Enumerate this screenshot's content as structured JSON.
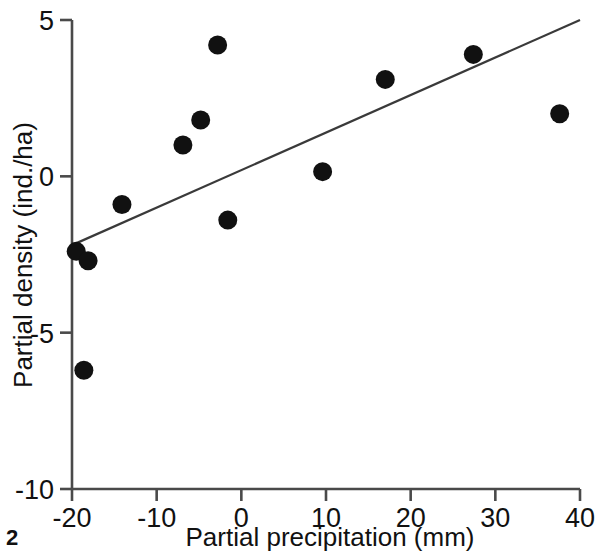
{
  "figure": {
    "number_label": "2",
    "line_color": "#3a3a3a",
    "point_color": "#111111",
    "axis_color": "#4a4a4a",
    "background_color": "#ffffff"
  },
  "chart_data": {
    "type": "scatter",
    "title": "",
    "xlabel": "Partial precipitation (mm)",
    "ylabel": "Partial density (ind./ha)",
    "xlim": [
      -20,
      40
    ],
    "ylim": [
      -10,
      5
    ],
    "xticks": [
      -20,
      -10,
      0,
      10,
      20,
      30,
      40
    ],
    "xtick_labels": [
      "-20",
      "-10",
      "0",
      "10",
      "20",
      "30",
      "40"
    ],
    "yticks": [
      -10,
      -5,
      0,
      5
    ],
    "ytick_labels": [
      "-10",
      "-5",
      "0",
      "5"
    ],
    "grid": false,
    "legend": false,
    "series": [
      {
        "name": "observations",
        "marker": "filled-circle",
        "points": [
          {
            "x": -19.5,
            "y": -2.4
          },
          {
            "x": -18.6,
            "y": -6.2
          },
          {
            "x": -18.1,
            "y": -2.7
          },
          {
            "x": -14.1,
            "y": -0.9
          },
          {
            "x": -6.9,
            "y": 1.0
          },
          {
            "x": -4.8,
            "y": 1.8
          },
          {
            "x": -2.8,
            "y": 4.2
          },
          {
            "x": -1.6,
            "y": -1.4
          },
          {
            "x": 9.6,
            "y": 0.15
          },
          {
            "x": 17.0,
            "y": 3.1
          },
          {
            "x": 27.4,
            "y": 3.9
          },
          {
            "x": 37.6,
            "y": 2.0
          }
        ]
      },
      {
        "name": "regression-line",
        "type": "line",
        "endpoints": [
          {
            "x": -20,
            "y": -2.2
          },
          {
            "x": 40,
            "y": 5.0
          }
        ]
      }
    ]
  }
}
